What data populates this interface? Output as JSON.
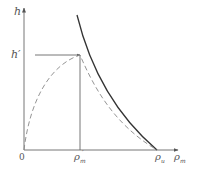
{
  "diagram": {
    "type": "phase-diagram",
    "axes": {
      "y_label": "h",
      "x_label": "ρ",
      "x_label_sub": "m",
      "origin_label": "0"
    },
    "marks": {
      "h_prime": "h′",
      "rho_m_prime": "ρ",
      "rho_m_prime_sub": "m",
      "rho_m_prime_sup": "′",
      "rho_u": "ρ",
      "rho_u_sub": "u"
    },
    "curves": [
      {
        "name": "solid-curve",
        "style": "solid",
        "description": "decreasing convex curve ending at ρu on x-axis"
      },
      {
        "name": "dashed-curve",
        "style": "dashed",
        "description": "rises from origin to peak (ρ′m, h′) then decreases to ρu"
      }
    ],
    "colors": {
      "axis": "#777777",
      "solid_curve": "#333333",
      "dashed_curve": "#888888",
      "guide_lines": "#666666",
      "text": "#555555"
    }
  }
}
